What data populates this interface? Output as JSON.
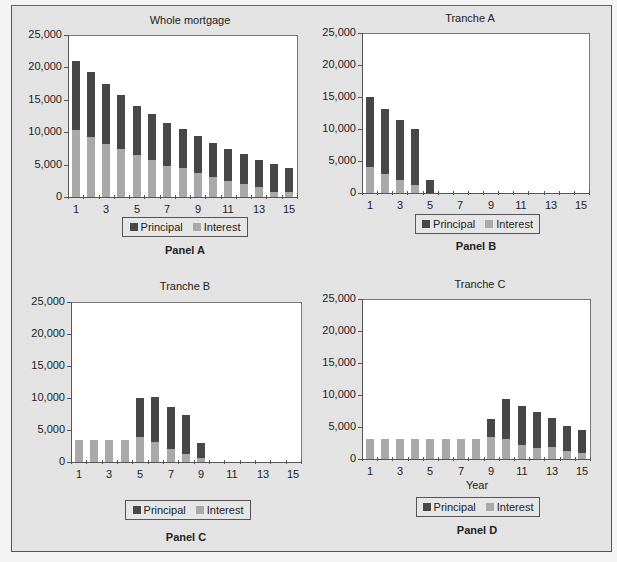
{
  "legend": {
    "principal_label": "Principal",
    "interest_label": "Interest",
    "principal_color": "#474747",
    "interest_color": "#a9a9a9"
  },
  "y_ticks": [
    "25,000",
    "20,000",
    "15,000",
    "10,000",
    "5,000",
    "0"
  ],
  "x_ticks": [
    "1",
    "3",
    "5",
    "7",
    "9",
    "11",
    "13",
    "15"
  ],
  "panels": [
    {
      "title": "Whole mortgage",
      "label": "Panel A",
      "xtitle": ""
    },
    {
      "title": "Tranche A",
      "label": "Panel B",
      "xtitle": ""
    },
    {
      "title": "Tranche B",
      "label": "Panel C",
      "xtitle": ""
    },
    {
      "title": "Tranche C",
      "label": "Panel D",
      "xtitle": "Year"
    }
  ],
  "chart_data": [
    {
      "type": "bar",
      "stacked": true,
      "title": "Whole mortgage",
      "panel": "Panel A",
      "xlabel": "",
      "ylabel": "",
      "ylim": [
        0,
        25000
      ],
      "categories": [
        1,
        2,
        3,
        4,
        5,
        6,
        7,
        8,
        9,
        10,
        11,
        12,
        13,
        14,
        15
      ],
      "series": [
        {
          "name": "Interest",
          "values": [
            10400,
            9300,
            8200,
            7350,
            6500,
            5650,
            4850,
            4400,
            3700,
            3150,
            2400,
            2000,
            1550,
            750,
            750
          ]
        },
        {
          "name": "Principal",
          "values": [
            10600,
            10000,
            9250,
            8400,
            7600,
            7200,
            6600,
            6150,
            5700,
            5200,
            5000,
            4650,
            4200,
            4400,
            3750
          ]
        }
      ],
      "totals": [
        21000,
        19300,
        17450,
        15750,
        14100,
        12850,
        11450,
        10550,
        9400,
        8350,
        7400,
        6650,
        5750,
        5150,
        4500
      ],
      "legend_position": "bottom"
    },
    {
      "type": "bar",
      "stacked": true,
      "title": "Tranche A",
      "panel": "Panel B",
      "xlabel": "",
      "ylabel": "",
      "ylim": [
        0,
        25000
      ],
      "categories": [
        1,
        2,
        3,
        4,
        5,
        6,
        7,
        8,
        9,
        10,
        11,
        12,
        13,
        14,
        15
      ],
      "series": [
        {
          "name": "Interest",
          "values": [
            4000,
            2900,
            2000,
            1200,
            0,
            0,
            0,
            0,
            0,
            0,
            0,
            0,
            0,
            0,
            0
          ]
        },
        {
          "name": "Principal",
          "values": [
            11000,
            10300,
            9400,
            8800,
            2050,
            0,
            0,
            0,
            0,
            0,
            0,
            0,
            0,
            0,
            0
          ]
        }
      ],
      "totals": [
        15000,
        13200,
        11400,
        10000,
        2050,
        0,
        0,
        0,
        0,
        0,
        0,
        0,
        0,
        0,
        0
      ],
      "legend_position": "bottom"
    },
    {
      "type": "bar",
      "stacked": true,
      "title": "Tranche B",
      "panel": "Panel C",
      "xlabel": "",
      "ylabel": "",
      "ylim": [
        0,
        25000
      ],
      "categories": [
        1,
        2,
        3,
        4,
        5,
        6,
        7,
        8,
        9,
        10,
        11,
        12,
        13,
        14,
        15
      ],
      "series": [
        {
          "name": "Interest",
          "values": [
            3400,
            3400,
            3400,
            3400,
            3950,
            3050,
            2000,
            1300,
            600,
            0,
            0,
            0,
            0,
            0,
            0
          ]
        },
        {
          "name": "Principal",
          "values": [
            0,
            0,
            0,
            0,
            6050,
            7100,
            6650,
            6100,
            2300,
            0,
            0,
            0,
            0,
            0,
            0
          ]
        }
      ],
      "totals": [
        3400,
        3400,
        3400,
        3400,
        10000,
        10150,
        8650,
        7400,
        2900,
        0,
        0,
        0,
        0,
        0,
        0
      ],
      "legend_position": "bottom"
    },
    {
      "type": "bar",
      "stacked": true,
      "title": "Tranche C",
      "panel": "Panel D",
      "xlabel": "Year",
      "ylabel": "",
      "ylim": [
        0,
        25000
      ],
      "categories": [
        1,
        2,
        3,
        4,
        5,
        6,
        7,
        8,
        9,
        10,
        11,
        12,
        13,
        14,
        15
      ],
      "series": [
        {
          "name": "Interest",
          "values": [
            3100,
            3100,
            3100,
            3150,
            3150,
            3150,
            3200,
            3200,
            3400,
            3200,
            2150,
            1700,
            1900,
            1250,
            900
          ]
        },
        {
          "name": "Principal",
          "values": [
            0,
            0,
            0,
            0,
            0,
            0,
            0,
            0,
            2900,
            6250,
            6200,
            5600,
            4450,
            3950,
            3650
          ]
        }
      ],
      "totals": [
        3100,
        3100,
        3100,
        3150,
        3150,
        3150,
        3200,
        3200,
        6300,
        9450,
        8350,
        7300,
        6350,
        5200,
        4550
      ],
      "legend_position": "bottom"
    }
  ]
}
